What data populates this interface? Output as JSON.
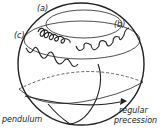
{
  "diagram": {
    "labels": {
      "a": "(a)",
      "b": "(b)",
      "c": "(c)",
      "pendulum": "pendulum",
      "regular": "regular",
      "precession": "precession"
    },
    "colors": {
      "stroke": "#222222",
      "background": "#ffffff"
    }
  }
}
